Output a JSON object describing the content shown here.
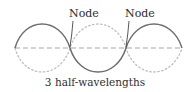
{
  "diagram": {
    "labels": {
      "node_left": "Node",
      "node_right": "Node",
      "caption": "3 half-wavelengths"
    },
    "colors": {
      "solid_wave": "#6e6e6e",
      "dotted_wave": "#bdbdbd",
      "axis": "#a8a8a8",
      "text": "#2e2e2e",
      "pointer": "#444444"
    },
    "geometry": {
      "axis_y": 48,
      "x_start": 15,
      "x_end": 182,
      "amplitude": 25,
      "half_wavelengths": 3,
      "node_positions_x": [
        70,
        126
      ]
    }
  }
}
